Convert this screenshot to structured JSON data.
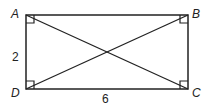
{
  "diagram": {
    "type": "rectangle-with-diagonals",
    "vertices": {
      "A": {
        "label": "A",
        "x": 26,
        "y": 15
      },
      "B": {
        "label": "B",
        "x": 188,
        "y": 15
      },
      "C": {
        "label": "C",
        "x": 188,
        "y": 89
      },
      "D": {
        "label": "D",
        "x": 26,
        "y": 89
      }
    },
    "side_labels": {
      "AD": "2",
      "DC": "6"
    },
    "right_angle_marks": [
      "A",
      "B",
      "C",
      "D"
    ],
    "diagonals": [
      "AC",
      "BD"
    ],
    "stroke_color": "#222222"
  }
}
